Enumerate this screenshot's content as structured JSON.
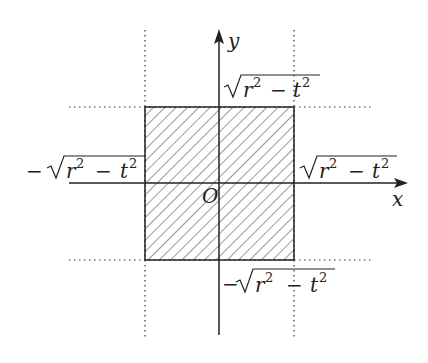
{
  "diagram": {
    "type": "coordinate-region",
    "axes": {
      "x_label": "x",
      "y_label": "y",
      "origin_label": "O"
    },
    "region": {
      "shape": "square",
      "fill": "diagonal-hatch",
      "description": "Hatched square centered at origin"
    },
    "labels": {
      "top": {
        "sign": "",
        "radicand_a": "r",
        "exp_a": "2",
        "op": "−",
        "radicand_b": "t",
        "exp_b": "2"
      },
      "bottom": {
        "sign": "−",
        "radicand_a": "r",
        "exp_a": "2",
        "op": "−",
        "radicand_b": "t",
        "exp_b": "2"
      },
      "left": {
        "sign": "−",
        "radicand_a": "r",
        "exp_a": "2",
        "op": "−",
        "radicand_b": "t",
        "exp_b": "2"
      },
      "right": {
        "sign": "",
        "radicand_a": "r",
        "exp_a": "2",
        "op": "−",
        "radicand_b": "t",
        "exp_b": "2"
      }
    },
    "colors": {
      "ink": "#222222",
      "background": "#ffffff"
    }
  }
}
